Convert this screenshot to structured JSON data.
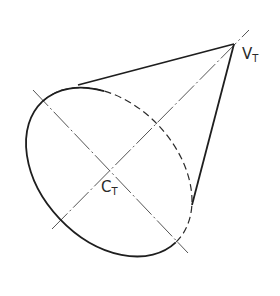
{
  "diagram": {
    "labels": {
      "apex": {
        "main": "V",
        "sub": "T"
      },
      "center": {
        "main": "C",
        "sub": "T"
      }
    },
    "geometry": {
      "apex": [
        234,
        44
      ],
      "base_center": [
        109,
        172
      ],
      "base_semi_major": 97,
      "base_semi_minor": 68,
      "base_rotation_deg": 46.5,
      "major_axis": {
        "from": [
          33,
          90
        ],
        "to": [
          188,
          253
        ]
      },
      "cone_axis": {
        "from": [
          52,
          229
        ],
        "to": [
          249,
          30
        ]
      },
      "tangent_upper": [
        78,
        85
      ],
      "tangent_right": [
        192,
        205
      ]
    },
    "colors": {
      "outline": "#1e1e1e",
      "centerline": "#555555",
      "background": "#ffffff"
    }
  }
}
